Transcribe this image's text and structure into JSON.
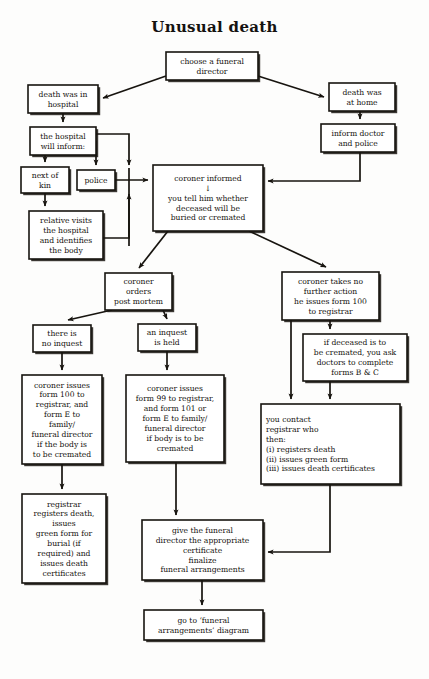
{
  "diagram": {
    "title": "Unusual death",
    "type": "flowchart",
    "colors": {
      "background": "#fdfdfc",
      "stroke": "#17140f",
      "box_fill": "#ffffff",
      "text": "#14110d"
    },
    "nodes": [
      {
        "id": "choose-funeral-director",
        "lines": [
          "choose a funeral",
          "director"
        ],
        "align": "center",
        "x": 166,
        "y": 52,
        "w": 92,
        "h": 28
      },
      {
        "id": "death-in-hospital",
        "lines": [
          "death was in",
          "hospital"
        ],
        "align": "center",
        "x": 28,
        "y": 85,
        "w": 70,
        "h": 28
      },
      {
        "id": "death-at-home",
        "lines": [
          "death was",
          "at home"
        ],
        "align": "center",
        "x": 329,
        "y": 83,
        "w": 66,
        "h": 28
      },
      {
        "id": "hospital-will-inform",
        "lines": [
          "the hospital",
          "will inform:"
        ],
        "align": "center",
        "x": 30,
        "y": 127,
        "w": 66,
        "h": 28
      },
      {
        "id": "inform-doctor-police",
        "lines": [
          "inform doctor",
          "and police"
        ],
        "align": "center",
        "x": 321,
        "y": 124,
        "w": 74,
        "h": 28
      },
      {
        "id": "next-of-kin",
        "lines": [
          "next of",
          "kin"
        ],
        "align": "center",
        "x": 21,
        "y": 167,
        "w": 48,
        "h": 26
      },
      {
        "id": "police",
        "lines": [
          "police"
        ],
        "align": "center",
        "x": 77,
        "y": 170,
        "w": 38,
        "h": 20
      },
      {
        "id": "coroner-informed",
        "lines": [
          "coroner informed",
          "↓",
          "you tell him whether",
          "deceased will be",
          "buried or cremated"
        ],
        "align": "center",
        "x": 153,
        "y": 165,
        "w": 110,
        "h": 66
      },
      {
        "id": "relative-visits",
        "lines": [
          "relative visits",
          "the hospital",
          "and identifies",
          "the body"
        ],
        "align": "center",
        "x": 29,
        "y": 211,
        "w": 74,
        "h": 48
      },
      {
        "id": "coroner-orders-post-mortem",
        "lines": [
          "coroner",
          "orders",
          "post mortem"
        ],
        "align": "center",
        "x": 105,
        "y": 273,
        "w": 67,
        "h": 37
      },
      {
        "id": "coroner-no-further-action",
        "lines": [
          "coroner takes no",
          "further action",
          "he issues form 100",
          "to registrar"
        ],
        "align": "center",
        "x": 282,
        "y": 272,
        "w": 97,
        "h": 48
      },
      {
        "id": "no-inquest",
        "lines": [
          "there is",
          "no inquest"
        ],
        "align": "center",
        "x": 33,
        "y": 325,
        "w": 58,
        "h": 27
      },
      {
        "id": "inquest-held",
        "lines": [
          "an inquest",
          "is held"
        ],
        "align": "center",
        "x": 138,
        "y": 324,
        "w": 58,
        "h": 27
      },
      {
        "id": "if-deceased-cremated",
        "lines": [
          "if deceased is to",
          "be cremated, you ask",
          "doctors to complete",
          "forms B & C"
        ],
        "align": "center",
        "x": 303,
        "y": 334,
        "w": 104,
        "h": 47
      },
      {
        "id": "coroner-issues-form-100",
        "lines": [
          "coroner issues",
          "form 100 to",
          "registrar, and",
          "form E to",
          "family/",
          "funeral director",
          "if the body is",
          "to be cremated"
        ],
        "align": "center",
        "x": 22,
        "y": 375,
        "w": 80,
        "h": 89
      },
      {
        "id": "coroner-issues-form-99",
        "lines": [
          "coroner issues",
          "form 99 to registrar,",
          "and form 101 or",
          "form E to family/",
          "funeral director",
          "if body is to be",
          "cremated"
        ],
        "align": "center",
        "x": 126,
        "y": 375,
        "w": 98,
        "h": 87
      },
      {
        "id": "you-contact-registrar",
        "lines": [
          "you contact",
          "registrar who",
          "then:",
          "(i) registers death",
          "(ii) issues green form",
          "(iii) issues death certificates"
        ],
        "align": "left",
        "x": 261,
        "y": 404,
        "w": 139,
        "h": 80
      },
      {
        "id": "registrar-registers-death",
        "lines": [
          "registrar",
          "registers death,",
          "issues",
          "green form for",
          "burial (if",
          "required) and",
          "issues death",
          "certificates"
        ],
        "align": "center",
        "x": 22,
        "y": 494,
        "w": 84,
        "h": 89
      },
      {
        "id": "give-funeral-director",
        "lines": [
          "give the funeral",
          "director the appropriate",
          "certificate",
          "finalize",
          "funeral arrangements"
        ],
        "align": "center",
        "x": 142,
        "y": 520,
        "w": 121,
        "h": 60
      },
      {
        "id": "go-to-funeral-arrangements",
        "lines": [
          "go to ‘funeral",
          "arrangements’ diagram"
        ],
        "align": "center",
        "x": 144,
        "y": 610,
        "w": 119,
        "h": 30
      }
    ],
    "edges": [
      {
        "id": "choose-to-hospital",
        "label": "choose a funeral director to death was in hospital"
      },
      {
        "id": "choose-to-home",
        "label": "choose a funeral director to death was at home"
      },
      {
        "id": "hospital-to-will-inform",
        "label": "death was in hospital to the hospital will inform"
      },
      {
        "id": "home-to-inform-doctor",
        "label": "death was at home to inform doctor and police"
      },
      {
        "id": "will-inform-to-next-of-kin",
        "label": "the hospital will inform to next of kin"
      },
      {
        "id": "will-inform-to-police",
        "label": "the hospital will inform to police"
      },
      {
        "id": "will-inform-to-coroner-bus",
        "label": "the hospital will inform to coroner bus"
      },
      {
        "id": "police-to-coroner",
        "label": "police to coroner informed"
      },
      {
        "id": "next-of-kin-to-relative",
        "label": "next of kin to relative visits"
      },
      {
        "id": "relative-to-coroner-bus",
        "label": "relative visits to coroner bus"
      },
      {
        "id": "inform-doctor-to-coroner",
        "label": "inform doctor and police to coroner informed"
      },
      {
        "id": "coroner-to-post-mortem",
        "label": "coroner informed to coroner orders post mortem"
      },
      {
        "id": "coroner-to-no-further-action",
        "label": "coroner informed to coroner takes no further action"
      },
      {
        "id": "post-mortem-to-no-inquest",
        "label": "coroner orders post mortem to there is no inquest"
      },
      {
        "id": "post-mortem-to-inquest-held",
        "label": "coroner orders post mortem to an inquest is held"
      },
      {
        "id": "no-further-action-to-if-cremated",
        "label": "coroner takes no further action to if deceased is to be cremated"
      },
      {
        "id": "no-further-action-to-contact-registrar",
        "label": "coroner takes no further action to you contact registrar"
      },
      {
        "id": "if-cremated-to-contact-registrar",
        "label": "if deceased is to be cremated to you contact registrar"
      },
      {
        "id": "no-inquest-to-form-100",
        "label": "there is no inquest to coroner issues form 100"
      },
      {
        "id": "inquest-held-to-form-99",
        "label": "an inquest is held to coroner issues form 99"
      },
      {
        "id": "form-100-to-registrar-registers",
        "label": "coroner issues form 100 to registrar registers death"
      },
      {
        "id": "form-99-to-give-funeral-director",
        "label": "coroner issues form 99 to give the funeral director"
      },
      {
        "id": "contact-registrar-to-give-funeral-director",
        "label": "you contact registrar to give the funeral director"
      },
      {
        "id": "give-funeral-director-to-go-to",
        "label": "give the funeral director to go to funeral arrangements diagram"
      }
    ]
  }
}
